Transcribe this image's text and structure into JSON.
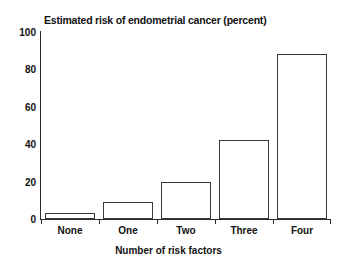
{
  "chart_data": {
    "type": "bar",
    "title": "Estimated risk of endometrial cancer (percent)",
    "xlabel": "Number of risk factors",
    "ylabel": "",
    "categories": [
      "None",
      "One",
      "Two",
      "Three",
      "Four"
    ],
    "values": [
      3,
      9,
      20,
      42,
      88
    ],
    "ylim": [
      0,
      100
    ],
    "yticks": [
      0,
      20,
      40,
      60,
      80,
      100
    ],
    "ytick_labels": [
      "0",
      "20",
      "40",
      "60",
      "80",
      "100"
    ],
    "grid": false,
    "legend": false,
    "legend_position": "none",
    "series": [
      {
        "name": "Estimated risk of endometrial cancer (percent)",
        "values": [
          3,
          9,
          20,
          42,
          88
        ]
      }
    ],
    "colors": {
      "bar_fill": "#ffffff",
      "bar_edge": "#3a3a3a",
      "axis": "#2b2b2b",
      "text": "#111111",
      "background": "#ffffff"
    }
  }
}
